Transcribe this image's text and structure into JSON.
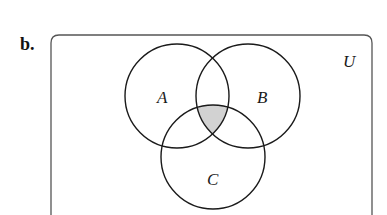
{
  "part_label": "b.",
  "universe": {
    "label": "U"
  },
  "sets": [
    {
      "name": "A",
      "cx": 177,
      "cy": 96,
      "r": 52,
      "label_x": 163,
      "label_y": 103
    },
    {
      "name": "B",
      "cx": 248,
      "cy": 96,
      "r": 52,
      "label_x": 262,
      "label_y": 103
    },
    {
      "name": "C",
      "cx": 213,
      "cy": 157,
      "r": 52,
      "label_x": 213,
      "label_y": 185
    }
  ],
  "shaded_region": "A ∩ B ∩ C",
  "colors": {
    "outline": "#1a1a1a",
    "shade": "#d2d2d2",
    "frame": "#555555"
  }
}
